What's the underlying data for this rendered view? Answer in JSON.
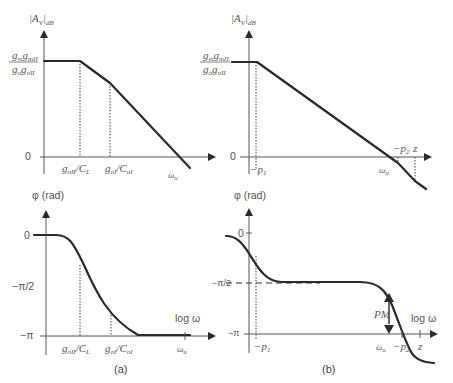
{
  "figure": {
    "panels": [
      {
        "id": "a",
        "caption": "(a)",
        "magnitude_plot": {
          "ylabel": "|A_V|dB",
          "ylabel_main": "|A",
          "ylabel_sub": "V",
          "ylabel_tail": "|",
          "ylabel_sub2": "dB",
          "dc_gain_numerator": "g_m g_mII",
          "dc_gain_denominator": "g_o g_oII",
          "dc_gain_num_text": "gmgmII",
          "dc_gain_den_text": "gogoII",
          "zero_label": "0",
          "x_markers": [
            {
              "label": "g_oII/C_L",
              "text": "goII/CL"
            },
            {
              "label": "g_oI/C_oI",
              "text": "goI/CoI"
            },
            {
              "label": "ω_u",
              "text": "ωu"
            }
          ]
        },
        "phase_plot": {
          "ylabel": "φ (rad)",
          "y_ticks": [
            "0",
            "−π/2",
            "−π"
          ],
          "xlabel": "log ω",
          "x_markers": [
            {
              "label": "g_oII/C_L",
              "text": "goII/CL"
            },
            {
              "label": "g_oI/C_oI",
              "text": "goI/CoI"
            },
            {
              "label": "ω_u",
              "text": "ωu"
            }
          ]
        }
      },
      {
        "id": "b",
        "caption": "(b)",
        "magnitude_plot": {
          "ylabel": "|A_V|dB",
          "dc_gain_numerator": "g_m g_mII",
          "dc_gain_denominator": "g_o g_oII",
          "zero_label": "0",
          "x_markers": [
            {
              "label": "−p_1",
              "text": "−p1"
            },
            {
              "label": "ω_u",
              "text": "ωu"
            },
            {
              "label": "−p_2",
              "text": "−p2"
            },
            {
              "label": "z",
              "text": "z"
            }
          ]
        },
        "phase_plot": {
          "ylabel": "φ (rad)",
          "y_ticks": [
            "0",
            "−π/2",
            "−π"
          ],
          "xlabel": "log ω",
          "annotation": "PM",
          "x_markers": [
            {
              "label": "−p_1",
              "text": "−p1"
            },
            {
              "label": "ω_u",
              "text": "ωu"
            },
            {
              "label": "−p_2",
              "text": "−p2"
            },
            {
              "label": "z",
              "text": "z"
            }
          ]
        }
      }
    ],
    "text": {
      "A": "A",
      "V": "V",
      "dB": "dB",
      "bar": "|",
      "phi_rad": "φ (rad)",
      "zero": "0",
      "minus_pi_half": "−π/2",
      "minus_pi": "−π",
      "log_omega": "log ω",
      "PM": "PM",
      "g": "g",
      "m": "m",
      "mII": "mII",
      "o": "o",
      "oII": "oII",
      "oI": "oI",
      "slash": "/",
      "C": "C",
      "L": "L",
      "omega": "ω",
      "u": "u",
      "minus_p": "−p",
      "one": "1",
      "two": "2",
      "z": "z",
      "cap_a": "(a)",
      "cap_b": "(b)"
    }
  }
}
